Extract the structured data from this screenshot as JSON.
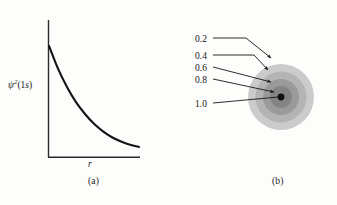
{
  "figure": {
    "panel_a": {
      "caption": "(a)",
      "ylabel_psi": "ψ",
      "ylabel_sup": "2",
      "ylabel_arg_open": "(1",
      "ylabel_arg_s": "s",
      "ylabel_arg_close": ")",
      "xlabel": "r"
    },
    "panel_b": {
      "caption": "(b)",
      "contour_labels": [
        "0.2",
        "0.4",
        "0.6",
        "0.8",
        "1.0"
      ]
    }
  },
  "colors": {
    "background": "#fdfdfc",
    "ink": "#1a1a1a",
    "curve": "#141414",
    "axis": "#2b2b2b",
    "shell_1": "#cbcbcb",
    "shell_2": "#b4b4b4",
    "shell_3": "#9a9a9a",
    "shell_4": "#848484",
    "nucleus": "#111111"
  },
  "chart_data": [
    {
      "type": "line",
      "title": "(a)",
      "xlabel": "r",
      "ylabel": "ψ²(1s)",
      "description": "Exponential decay of the 1s orbital probability density with distance r from the nucleus",
      "grid": false,
      "legend": "none",
      "xlim": [
        0,
        1
      ],
      "ylim": [
        0,
        1
      ],
      "x": [
        0.0,
        0.1,
        0.2,
        0.3,
        0.4,
        0.5,
        0.6,
        0.7,
        0.8,
        0.9,
        1.0
      ],
      "y": [
        1.0,
        0.79,
        0.62,
        0.48,
        0.37,
        0.28,
        0.21,
        0.155,
        0.115,
        0.085,
        0.065
      ],
      "axis_ticks": {
        "x": [],
        "y": []
      }
    },
    {
      "type": "contour",
      "title": "(b)",
      "description": "Concentric electron-density contour shells of the 1s orbital, labelled by relative probability density",
      "grid": false,
      "legend": "none",
      "contour_levels": [
        0.2,
        0.4,
        0.6,
        0.8,
        1.0
      ],
      "contour_radii_px": [
        33,
        25.5,
        18,
        11,
        3.4
      ],
      "contour_fills": [
        "#cbcbcb",
        "#b4b4b4",
        "#9a9a9a",
        "#848484",
        "#111111"
      ],
      "center_px": {
        "x": 281,
        "y": 97
      }
    }
  ]
}
